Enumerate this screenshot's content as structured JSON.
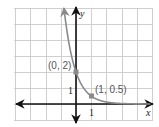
{
  "chart_data": {
    "type": "line",
    "title": "",
    "xlabel": "x",
    "ylabel": "y",
    "function": "y = 2(1/4)^x",
    "xlim": [
      -4,
      5
    ],
    "ylim": [
      -1,
      6
    ],
    "grid": true,
    "series": [
      {
        "name": "exponential decay",
        "x": [
          -0.79,
          -0.5,
          0,
          0.5,
          1,
          1.5,
          2,
          3,
          4.9
        ],
        "y": [
          6,
          4,
          2,
          1,
          0.5,
          0.25,
          0.125,
          0.03,
          0.002
        ]
      }
    ],
    "points": [
      {
        "x": 0,
        "y": 2,
        "label": "(0, 2)"
      },
      {
        "x": 1,
        "y": 0.5,
        "label": "(1, 0.5)"
      }
    ],
    "tick_labels": {
      "x": [
        "1"
      ],
      "y": [
        "1"
      ]
    },
    "colors": {
      "curve": "#8a8a8a",
      "axis": "#111111",
      "grid": "#cfcfcf",
      "label": "#555555"
    }
  },
  "labels": {
    "x_axis": "x",
    "y_axis": "y",
    "x_tick": "1",
    "y_tick": "1",
    "point_a": "(0, 2)",
    "point_b": "(1, 0.5)"
  }
}
